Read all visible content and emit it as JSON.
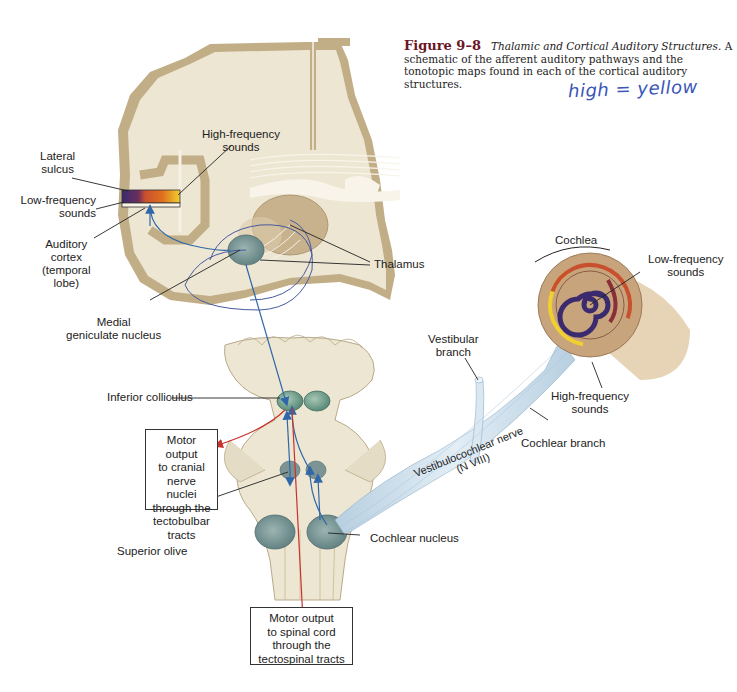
{
  "caption": {
    "figure_number": "Figure 9–8",
    "title": "Thalamic and Cortical Auditory Structures.",
    "body": "A schematic of the afferent auditory pathways and the tonotopic maps found in each of the cortical auditory structures."
  },
  "handwritten_note": "high = yellow",
  "labels": {
    "lateral_sulcus": [
      "Lateral",
      "sulcus"
    ],
    "low_frequency_cortex": [
      "Low-frequency",
      "sounds"
    ],
    "high_frequency_cortex": [
      "High-frequency",
      "sounds"
    ],
    "auditory_cortex": [
      "Auditory",
      "cortex",
      "(temporal",
      "lobe)"
    ],
    "thalamus": "Thalamus",
    "medial_geniculate": [
      "Medial",
      "geniculate nucleus"
    ],
    "cochlea": "Cochlea",
    "low_frequency_cochlea": [
      "Low-frequency",
      "sounds"
    ],
    "high_frequency_cochlea": [
      "High-frequency",
      "sounds"
    ],
    "vestibular_branch": [
      "Vestibular",
      "branch"
    ],
    "cochlear_branch": "Cochlear branch",
    "vestibulocochlear_nerve": [
      "Vestibulocochlear nerve",
      "(N VIII)"
    ],
    "inferior_colliculus": "Inferior colliculus",
    "superior_olive": "Superior olive",
    "cochlear_nucleus": "Cochlear nucleus"
  },
  "boxes": {
    "cranial_output": [
      "Motor output",
      "to cranial",
      "nerve nuclei",
      "through the",
      "tectobulbar",
      "tracts"
    ],
    "spinal_output": [
      "Motor output",
      "to spinal cord",
      "through the",
      "tectospinal tracts"
    ]
  },
  "tonotopic_colors": {
    "low": "#3b2a6e",
    "mid_low": "#c8502e",
    "mid": "#e0701e",
    "high": "#f0d030"
  },
  "colors": {
    "brain_tissue": "#ede6d3",
    "gray_matter": "#c2ae86",
    "nucleus": "#7f9a98",
    "pathway_blue": "#2f67a8",
    "motor_red": "#c8332b",
    "nerve": "#c9dbe8",
    "cochlea_shell": "#c8a47c",
    "caption_accent": "#6b1526"
  }
}
